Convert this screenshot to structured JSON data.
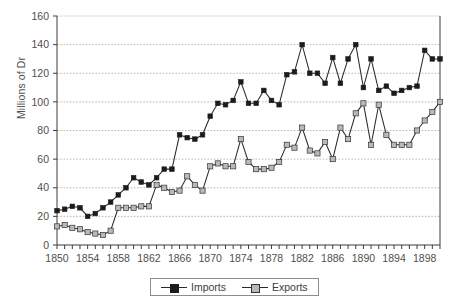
{
  "chart_data": {
    "type": "line",
    "title": "",
    "xlabel": "",
    "ylabel": "Millions of Dr",
    "xlim": [
      1850,
      1900
    ],
    "ylim": [
      0,
      160
    ],
    "ytick_step": 20,
    "yticks": [
      0,
      20,
      40,
      60,
      80,
      100,
      120,
      140,
      160
    ],
    "xticks_labeled": [
      1850,
      1854,
      1858,
      1862,
      1866,
      1870,
      1874,
      1878,
      1882,
      1886,
      1890,
      1894,
      1898
    ],
    "xtick_minor_step": 1,
    "grid": "horizontal-dotted",
    "legend_position": "bottom-center",
    "x": [
      1850,
      1851,
      1852,
      1853,
      1854,
      1855,
      1856,
      1857,
      1858,
      1859,
      1860,
      1861,
      1862,
      1863,
      1864,
      1865,
      1866,
      1867,
      1868,
      1869,
      1870,
      1871,
      1872,
      1873,
      1874,
      1875,
      1876,
      1877,
      1878,
      1879,
      1880,
      1881,
      1882,
      1883,
      1884,
      1885,
      1886,
      1887,
      1888,
      1889,
      1890,
      1891,
      1892,
      1893,
      1894,
      1895,
      1896,
      1897,
      1898,
      1899,
      1900
    ],
    "series": [
      {
        "name": "Imports",
        "marker": "filled-square",
        "color": "#1c1c1c",
        "values": [
          24,
          25,
          27,
          26,
          20,
          22,
          26,
          30,
          35,
          40,
          47,
          44,
          42,
          47,
          53,
          53,
          77,
          75,
          74,
          77,
          90,
          99,
          98,
          101,
          114,
          99,
          99,
          108,
          101,
          98,
          119,
          121,
          140,
          120,
          120,
          113,
          131,
          113,
          130,
          140,
          110,
          130,
          108,
          111,
          106,
          108,
          110,
          111,
          136,
          130,
          130
        ]
      },
      {
        "name": "Exports",
        "marker": "open-square",
        "color": "#b9b9b9",
        "values": [
          13,
          14,
          12,
          11,
          9,
          8,
          7,
          10,
          26,
          26,
          26,
          27,
          27,
          42,
          40,
          37,
          38,
          48,
          42,
          38,
          55,
          57,
          55,
          55,
          74,
          58,
          53,
          53,
          54,
          58,
          70,
          68,
          82,
          66,
          64,
          72,
          60,
          82,
          74,
          92,
          99,
          70,
          98,
          77,
          70,
          70,
          70,
          80,
          87,
          93,
          100
        ]
      }
    ]
  },
  "legend": {
    "items": [
      {
        "label": "Imports"
      },
      {
        "label": "Exports"
      }
    ]
  }
}
